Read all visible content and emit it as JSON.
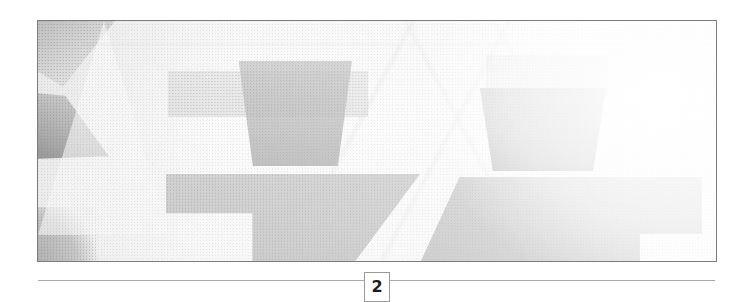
{
  "document": {
    "page_number": "2",
    "page_background": "#ffffff"
  },
  "figure": {
    "alt_description": "faded halftone photograph of an interior scene",
    "border_color": "#7c7c7c",
    "base_tone": "#f2f2f2"
  },
  "footer": {
    "rule_color": "#a8a8a8",
    "page_number": "2",
    "box_border_color": "#9a9a9a"
  }
}
